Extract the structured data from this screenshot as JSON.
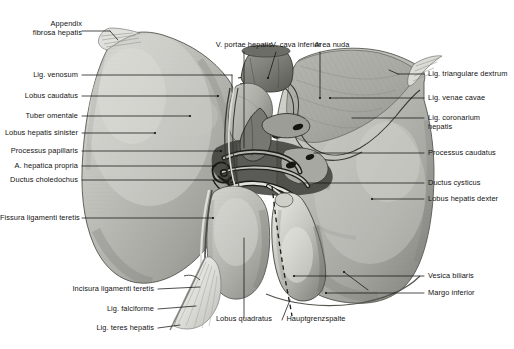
{
  "figure": {
    "background_color": "#ffffff",
    "ink_color": "#121212",
    "organ_base_color": "#b9b9b4",
    "organ_shadow_color": "#6e6e69",
    "organ_highlight_color": "#d8d8d3",
    "width": 514,
    "height": 349
  },
  "labels": {
    "appendix_fibrosa_hepatis": "Appendix\nfibrosa hepatis",
    "lig_venosum": "Lig. venosum",
    "lobus_caudatus": "Lobus caudatus",
    "tuber_omentale": "Tuber omentale",
    "lobus_hepatis_sinister": "Lobus hepatis sinister",
    "processus_papillaris": "Processus papillaris",
    "a_hepatica_propria": "A. hepatica propria",
    "ductus_choledochus": "Ductus choledochus",
    "fissura_ligamenti_teretis": "Fissura ligamenti teretis",
    "incisura_ligamenti_teretis": "Incisura ligamenti teretis",
    "lig_falciforme": "Lig. falciforme",
    "lig_teres_hepatis": "Lig. teres hepatis",
    "v_portae_hepatis": "V. portae hepatis",
    "v_cava_inferior": "V. cava inferior",
    "area_nuda": "Area nuda",
    "lig_triangulare_dextrum": "Lig. triangulare dextrum",
    "lig_venae_cavae": "Lig. venae cavae",
    "lig_coronarium_hepatis": "Lig. coronarium\nhepatis",
    "processus_caudatus": "Processus caudatus",
    "ductus_cysticus": "Ductus cysticus",
    "lobus_hepatis_dexter": "Lobus hepatis dexter",
    "vesica_biliaris": "Vesica biliaris",
    "margo_inferior": "Margo inferior",
    "lobus_quadratus": "Lobus quadratus",
    "hauptgrenzspalte": "Hauptgrenzspalte"
  }
}
